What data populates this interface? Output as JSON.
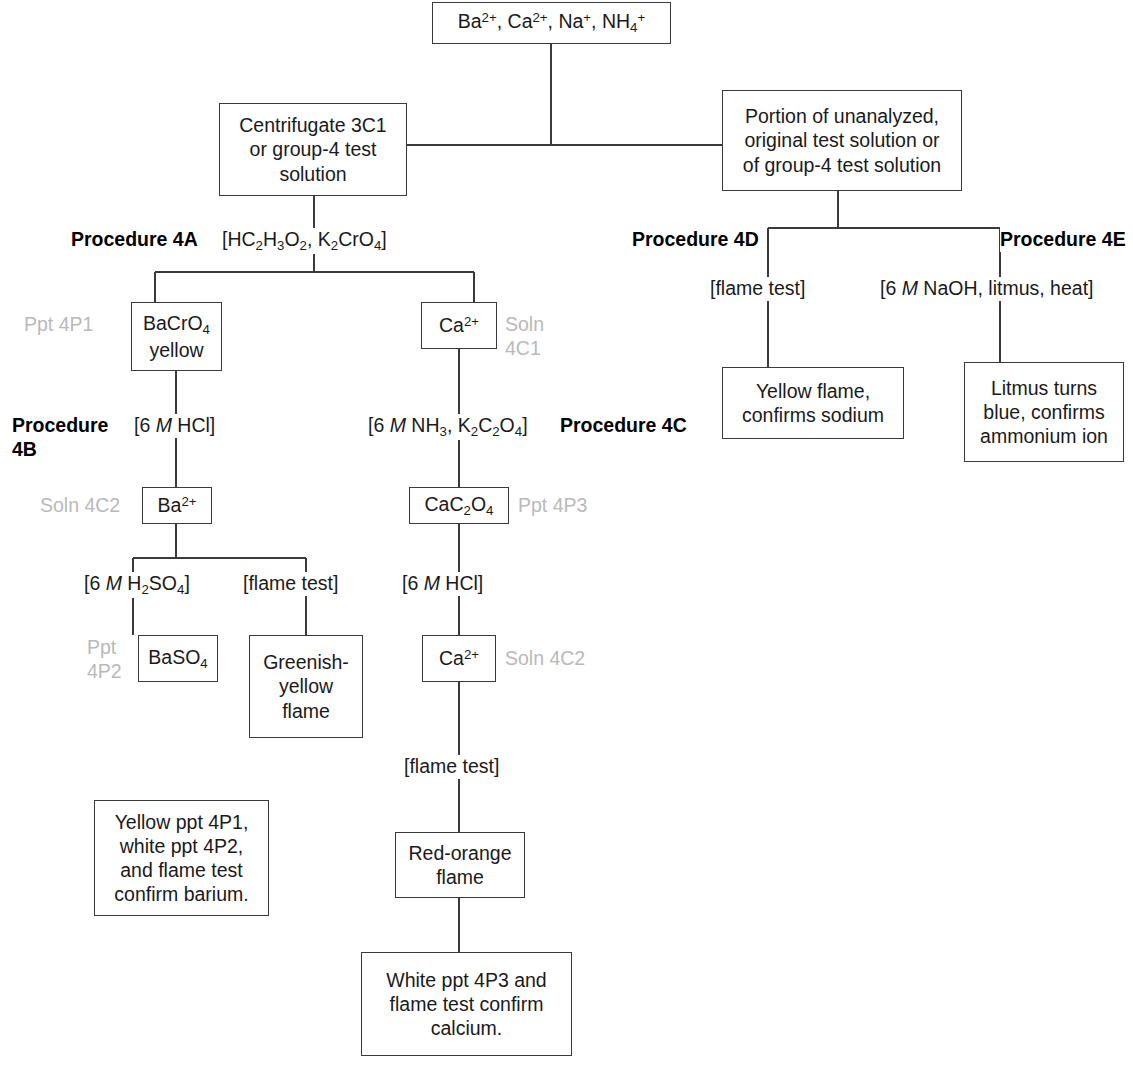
{
  "nodes": {
    "top_ions": "Ba2+, Ca2+, Na+, NH4+",
    "centrifugate": "Centrifugate 3C1 or group-4 test solution",
    "portion": "Portion of unanalyzed, original test solution or of group-4 test solution",
    "bacro4": "BaCrO4 yellow",
    "ca_1": "Ca2+",
    "ba_2": "Ba2+",
    "cac2o4": "CaC2O4",
    "baso4": "BaSO4",
    "greenish_flame": "Greenish-yellow flame",
    "ca_2": "Ca2+",
    "red_orange_flame": "Red-orange flame",
    "barium_confirm": "Yellow ppt 4P1, white ppt 4P2, and flame test confirm barium.",
    "calcium_confirm": "White ppt 4P3 and flame test confirm calcium.",
    "yellow_flame": "Yellow flame, confirms sodium",
    "litmus": "Litmus turns blue, confirms ammonium ion"
  },
  "procedures": {
    "p4a": "Procedure 4A",
    "p4b": "Procedure 4B",
    "p4c": "Procedure 4C",
    "p4d": "Procedure 4D",
    "p4e": "Procedure 4E"
  },
  "reagents": {
    "r4a": "[HC2H3O2, K2CrO4]",
    "r4b": "[6 M HCl]",
    "r4c": "[6 M NH3, K2C2O4]",
    "r_h2so4": "[6 M H2SO4]",
    "r_flame_ba": "[flame test]",
    "r_hcl_ca": "[6 M HCl]",
    "r_flame_ca": "[flame test]",
    "r_flame_na": "[flame test]",
    "r_naoh": "[6 M NaOH, litmus, heat]"
  },
  "fraction_labels": {
    "ppt_4p1": "Ppt 4P1",
    "soln_4c1": "Soln\n4C1",
    "soln_4c2_left": "Soln 4C2",
    "ppt_4p3": "Ppt 4P3",
    "ppt_4p2": "Ppt\n4P2",
    "soln_4c2_mid": "Soln 4C2"
  },
  "colors": {
    "line": "#3a3a3a",
    "gray_label": "#b9b9b9",
    "text": "#1a1a1a"
  }
}
